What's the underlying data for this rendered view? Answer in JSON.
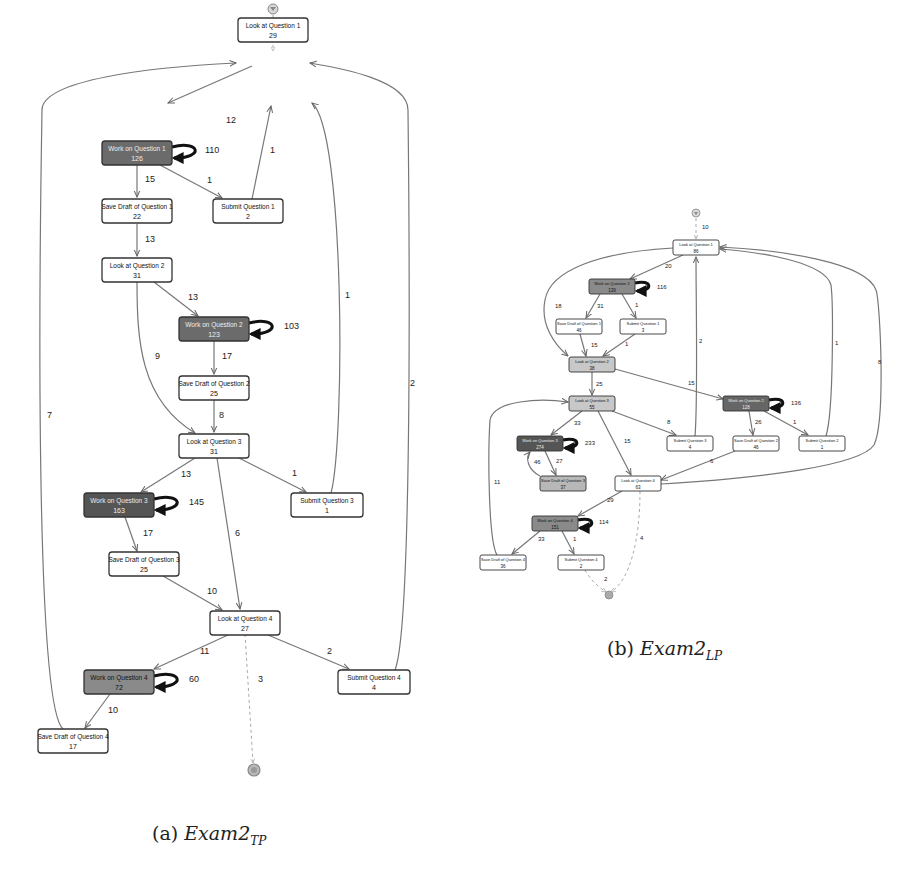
{
  "figure": {
    "subfigures": [
      {
        "id": "a",
        "caption_prefix": "(a)",
        "caption_main": "Exam2",
        "caption_sub": "TP",
        "start_edge_label": "7",
        "end_edge_label": "3",
        "nodes": [
          {
            "id": "L1",
            "label": "Look at Question 1",
            "count": "29",
            "x": 238,
            "y": 18,
            "w": 70,
            "h": 24,
            "fill": "#ffffff",
            "text": "#111"
          },
          {
            "id": "W1",
            "label": "Work on Question 1",
            "count": "126",
            "x": 102,
            "y": 141,
            "w": 70,
            "h": 24,
            "fill": "#6b6b6b",
            "text": "#eeeeee"
          },
          {
            "id": "S1",
            "label": "Save Draft of Question 1",
            "count": "22",
            "x": 102,
            "y": 199,
            "w": 70,
            "h": 24,
            "fill": "#ffffff",
            "text": "#111"
          },
          {
            "id": "U1",
            "label": "Submit Question 1",
            "count": "2",
            "x": 213,
            "y": 199,
            "w": 70,
            "h": 24,
            "fill": "#ffffff",
            "text": "#111"
          },
          {
            "id": "L2",
            "label": "Look at Question 2",
            "count": "31",
            "x": 102,
            "y": 258,
            "w": 70,
            "h": 24,
            "fill": "#ffffff",
            "text": "#111"
          },
          {
            "id": "W2",
            "label": "Work on Question 2",
            "count": "123",
            "x": 179,
            "y": 317,
            "w": 70,
            "h": 24,
            "fill": "#6b6b6b",
            "text": "#eeeeee"
          },
          {
            "id": "S2",
            "label": "Save Draft of Question 2",
            "count": "25",
            "x": 179,
            "y": 376,
            "w": 70,
            "h": 24,
            "fill": "#ffffff",
            "text": "#111"
          },
          {
            "id": "L3",
            "label": "Look at Question 3",
            "count": "31",
            "x": 179,
            "y": 434,
            "w": 70,
            "h": 24,
            "fill": "#ffffff",
            "text": "#111"
          },
          {
            "id": "W3",
            "label": "Work on Question 3",
            "count": "163",
            "x": 84,
            "y": 493,
            "w": 70,
            "h": 24,
            "fill": "#555555",
            "text": "#eeeeee"
          },
          {
            "id": "U3",
            "label": "Submit Question 3",
            "count": "1",
            "x": 291,
            "y": 493,
            "w": 72,
            "h": 24,
            "fill": "#ffffff",
            "text": "#111"
          },
          {
            "id": "S3",
            "label": "Save Draft of Question 3",
            "count": "25",
            "x": 109,
            "y": 552,
            "w": 70,
            "h": 24,
            "fill": "#ffffff",
            "text": "#111"
          },
          {
            "id": "L4",
            "label": "Look at Question 4",
            "count": "27",
            "x": 210,
            "y": 611,
            "w": 70,
            "h": 24,
            "fill": "#ffffff",
            "text": "#111"
          },
          {
            "id": "W4",
            "label": "Work on Question 4",
            "count": "72",
            "x": 84,
            "y": 670,
            "w": 70,
            "h": 24,
            "fill": "#8a8a8a",
            "text": "#111"
          },
          {
            "id": "U4",
            "label": "Submit Question 4",
            "count": "4",
            "x": 338,
            "y": 670,
            "w": 72,
            "h": 24,
            "fill": "#ffffff",
            "text": "#111"
          },
          {
            "id": "S4",
            "label": "Save Draft of Question 4",
            "count": "17",
            "x": 38,
            "y": 729,
            "w": 70,
            "h": 24,
            "fill": "#ffffff",
            "text": "#111"
          }
        ],
        "edges": [
          {
            "from": "L1",
            "to": "W1",
            "label": "12"
          },
          {
            "from": "W1",
            "to": "W1",
            "label": "110",
            "loop": true
          },
          {
            "from": "W1",
            "to": "S1",
            "label": "15"
          },
          {
            "from": "W1",
            "to": "U1",
            "label": "1"
          },
          {
            "from": "U1",
            "to": "L1",
            "label": "1"
          },
          {
            "from": "S1",
            "to": "L2",
            "label": "13"
          },
          {
            "from": "L2",
            "to": "W2",
            "label": "13"
          },
          {
            "from": "L2",
            "to": "L3",
            "label": "9"
          },
          {
            "from": "W2",
            "to": "W2",
            "label": "103",
            "loop": true
          },
          {
            "from": "W2",
            "to": "S2",
            "label": "17"
          },
          {
            "from": "S2",
            "to": "L3",
            "label": "8"
          },
          {
            "from": "L3",
            "to": "W3",
            "label": "13"
          },
          {
            "from": "L3",
            "to": "U3",
            "label": "1"
          },
          {
            "from": "L3",
            "to": "L4",
            "label": "6"
          },
          {
            "from": "W3",
            "to": "W3",
            "label": "145",
            "loop": true
          },
          {
            "from": "W3",
            "to": "S3",
            "label": "17"
          },
          {
            "from": "U3",
            "to": "L1",
            "label": "1"
          },
          {
            "from": "S3",
            "to": "L4",
            "label": "10"
          },
          {
            "from": "L4",
            "to": "W4",
            "label": "11"
          },
          {
            "from": "L4",
            "to": "U4",
            "label": "2"
          },
          {
            "from": "W4",
            "to": "W4",
            "label": "60",
            "loop": true
          },
          {
            "from": "W4",
            "to": "S4",
            "label": "10"
          },
          {
            "from": "S4",
            "to": "L1",
            "label": "7"
          },
          {
            "from": "U4",
            "to": "L1",
            "label": "2"
          }
        ]
      },
      {
        "id": "b",
        "caption_prefix": "(b)",
        "caption_main": "Exam2",
        "caption_sub": "LP",
        "start_edge_label": "10",
        "end_edge_labels": [
          "2",
          "4"
        ],
        "nodes": [
          {
            "id": "L1",
            "label": "Look at Question 1",
            "count": "86",
            "x": 673,
            "y": 240,
            "w": 46,
            "h": 15,
            "fill": "#ffffff",
            "text": "#111"
          },
          {
            "id": "W1",
            "label": "Work on Question 1",
            "count": "139",
            "x": 589,
            "y": 279,
            "w": 46,
            "h": 15,
            "fill": "#8a8a8a",
            "text": "#111"
          },
          {
            "id": "S1",
            "label": "Save Draft of Question 1",
            "count": "46",
            "x": 556,
            "y": 319,
            "w": 46,
            "h": 15,
            "fill": "#ffffff",
            "text": "#111"
          },
          {
            "id": "U1",
            "label": "Submit Question 1",
            "count": "3",
            "x": 620,
            "y": 319,
            "w": 46,
            "h": 15,
            "fill": "#ffffff",
            "text": "#111"
          },
          {
            "id": "L2",
            "label": "Look at Question 2",
            "count": "38",
            "x": 569,
            "y": 357,
            "w": 46,
            "h": 15,
            "fill": "#c8c8c8",
            "text": "#111"
          },
          {
            "id": "L3",
            "label": "Look at Question 3",
            "count": "55",
            "x": 569,
            "y": 396,
            "w": 46,
            "h": 15,
            "fill": "#c8c8c8",
            "text": "#111"
          },
          {
            "id": "W2",
            "label": "Work on Question 2",
            "count": "128",
            "x": 723,
            "y": 396,
            "w": 46,
            "h": 15,
            "fill": "#666666",
            "text": "#eeeeee"
          },
          {
            "id": "W3",
            "label": "Work on Question 3",
            "count": "274",
            "x": 517,
            "y": 436,
            "w": 46,
            "h": 15,
            "fill": "#555555",
            "text": "#eeeeee"
          },
          {
            "id": "U3",
            "label": "Submit Question 3",
            "count": "4",
            "x": 667,
            "y": 436,
            "w": 46,
            "h": 15,
            "fill": "#ffffff",
            "text": "#111"
          },
          {
            "id": "S2",
            "label": "Save Draft of Question 2",
            "count": "46",
            "x": 733,
            "y": 436,
            "w": 46,
            "h": 15,
            "fill": "#ffffff",
            "text": "#111"
          },
          {
            "id": "U2",
            "label": "Submit Question 2",
            "count": "1",
            "x": 799,
            "y": 436,
            "w": 46,
            "h": 15,
            "fill": "#ffffff",
            "text": "#111"
          },
          {
            "id": "S3",
            "label": "Save Draft of Question 3",
            "count": "37",
            "x": 540,
            "y": 476,
            "w": 46,
            "h": 15,
            "fill": "#b8b8b8",
            "text": "#111"
          },
          {
            "id": "L4",
            "label": "Look at Question 4",
            "count": "63",
            "x": 615,
            "y": 476,
            "w": 46,
            "h": 15,
            "fill": "#ffffff",
            "text": "#111"
          },
          {
            "id": "W4",
            "label": "Work on Question 4",
            "count": "151",
            "x": 532,
            "y": 516,
            "w": 46,
            "h": 15,
            "fill": "#8a8a8a",
            "text": "#111"
          },
          {
            "id": "S4",
            "label": "Save Draft of Question 4",
            "count": "36",
            "x": 480,
            "y": 555,
            "w": 46,
            "h": 15,
            "fill": "#ffffff",
            "text": "#111"
          },
          {
            "id": "U4",
            "label": "Submit Question 4",
            "count": "2",
            "x": 558,
            "y": 555,
            "w": 46,
            "h": 15,
            "fill": "#ffffff",
            "text": "#111"
          }
        ],
        "edges": [
          {
            "from": "L1",
            "to": "W1",
            "label": "20"
          },
          {
            "from": "W1",
            "to": "W1",
            "label": "116",
            "loop": true
          },
          {
            "from": "W1",
            "to": "S1",
            "label": "31"
          },
          {
            "from": "W1",
            "to": "U1",
            "label": "1"
          },
          {
            "from": "L1",
            "to": "L2",
            "label": "18"
          },
          {
            "from": "S1",
            "to": "L2",
            "label": "15"
          },
          {
            "from": "U1",
            "to": "L2",
            "label": "1"
          },
          {
            "from": "L2",
            "to": "L3",
            "label": "25"
          },
          {
            "from": "L2",
            "to": "W2",
            "label": "15"
          },
          {
            "from": "W2",
            "to": "W2",
            "label": "136",
            "loop": true
          },
          {
            "from": "W2",
            "to": "S2",
            "label": "26"
          },
          {
            "from": "W2",
            "to": "U2",
            "label": "1"
          },
          {
            "from": "L3",
            "to": "W3",
            "label": "33"
          },
          {
            "from": "L3",
            "to": "U3",
            "label": "8"
          },
          {
            "from": "L3",
            "to": "L4",
            "label": "15"
          },
          {
            "from": "W3",
            "to": "W3",
            "label": "233",
            "loop": true
          },
          {
            "from": "W3",
            "to": "S3",
            "label": "27"
          },
          {
            "from": "S3",
            "to": "W3",
            "label": "46"
          },
          {
            "from": "U3",
            "to": "L1",
            "label": "2"
          },
          {
            "from": "U2",
            "to": "L1",
            "label": "1"
          },
          {
            "from": "S2",
            "to": "L4",
            "label": "6"
          },
          {
            "from": "L4",
            "to": "L1",
            "label": "8"
          },
          {
            "from": "L4",
            "to": "W4",
            "label": "29"
          },
          {
            "from": "W4",
            "to": "W4",
            "label": "114",
            "loop": true
          },
          {
            "from": "W4",
            "to": "S4",
            "label": "33"
          },
          {
            "from": "W4",
            "to": "U4",
            "label": "1"
          },
          {
            "from": "S4",
            "to": "L3",
            "label": "11"
          }
        ]
      }
    ]
  }
}
